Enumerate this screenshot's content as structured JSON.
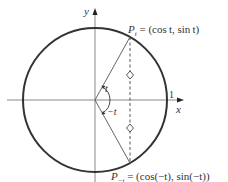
{
  "diagram": {
    "axes": {
      "x_label": "x",
      "y_label": "y",
      "unit_tick_label": "1"
    },
    "angle_labels": {
      "positive": "t",
      "negative": "−t"
    },
    "points": {
      "upper": {
        "label_main": "P",
        "label_sub": "t",
        "label_rest": " = (cos t, sin t)"
      },
      "lower": {
        "label_main": "P",
        "label_sub": "−t",
        "label_rest": " = (cos(−t), sin(−t))"
      }
    },
    "angle_t_degrees": 61,
    "colors": {
      "circle": "#333333",
      "axes": "#888888",
      "radius": "#555555",
      "dashed": "#444444"
    }
  }
}
